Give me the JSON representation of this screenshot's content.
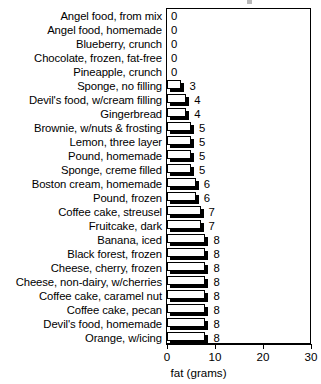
{
  "chart_data": {
    "type": "bar",
    "orientation": "horizontal",
    "title": "",
    "xlabel": "fat (grams)",
    "ylabel": "",
    "xlim": [
      0,
      30
    ],
    "xticks": [
      0,
      10,
      20,
      30
    ],
    "xtick_labels": [
      "0",
      "10",
      "20",
      "30"
    ],
    "grid": false,
    "legend": null,
    "value_labels": true,
    "categories": [
      "Angel food, from mix",
      "Angel food, homemade",
      "Blueberry, crunch",
      "Chocolate, frozen, fat-free",
      "Pineapple, crunch",
      "Sponge, no filling",
      "Devil's food, w/cream filling",
      "Gingerbread",
      "Brownie, w/nuts & frosting",
      "Lemon, three layer",
      "Pound, homemade",
      "Sponge, creme filled",
      "Boston cream, homemade",
      "Pound, frozen",
      "Coffee cake, streusel",
      "Fruitcake, dark",
      "Banana, iced",
      "Black forest, frozen",
      "Cheese, cherry, frozen",
      "Cheese, non-dairy, w/cherries",
      "Coffee cake, caramel nut",
      "Coffee cake, pecan",
      "Devil's food, homemade",
      "Orange, w/icing"
    ],
    "values": [
      0,
      0,
      0,
      0,
      0,
      3,
      4,
      4,
      5,
      5,
      5,
      5,
      6,
      6,
      7,
      7,
      8,
      8,
      8,
      8,
      8,
      8,
      8,
      8
    ],
    "value_text": [
      "0",
      "0",
      "0",
      "0",
      "0",
      "3",
      "4",
      "4",
      "5",
      "5",
      "5",
      "5",
      "6",
      "6",
      "7",
      "7",
      "8",
      "8",
      "8",
      "8",
      "8",
      "8",
      "8",
      "8"
    ]
  },
  "colors": {
    "bar_fill": "#ffffff",
    "bar_outline": "#000000",
    "bar_shadow": "#000000",
    "background": "#ffffff",
    "text": "#000000"
  }
}
